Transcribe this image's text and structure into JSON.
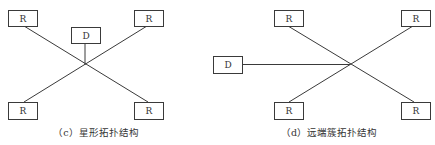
{
  "diagrams": [
    {
      "id": "c",
      "caption": "（c）星形拓扑结构",
      "center": {
        "x": 85,
        "y": 65
      },
      "nodes": [
        {
          "label": "R",
          "pos": "top-left",
          "x": 8,
          "y": 10,
          "w": 29,
          "h": 16
        },
        {
          "label": "R",
          "pos": "top-right",
          "x": 134,
          "y": 10,
          "w": 29,
          "h": 16
        },
        {
          "label": "D",
          "pos": "top-center",
          "x": 71,
          "y": 27,
          "w": 29,
          "h": 16
        },
        {
          "label": "R",
          "pos": "bottom-left",
          "x": 8,
          "y": 102,
          "w": 29,
          "h": 17
        },
        {
          "label": "R",
          "pos": "bottom-right",
          "x": 134,
          "y": 102,
          "w": 29,
          "h": 17
        }
      ]
    },
    {
      "id": "d",
      "caption": "（d）远端簇拓扑结构",
      "center": {
        "x": 350,
        "y": 64
      },
      "nodes": [
        {
          "label": "R",
          "pos": "top-left",
          "x": 274,
          "y": 10,
          "w": 29,
          "h": 16
        },
        {
          "label": "R",
          "pos": "top-right",
          "x": 401,
          "y": 10,
          "w": 29,
          "h": 16
        },
        {
          "label": "D",
          "pos": "left",
          "x": 213,
          "y": 56,
          "w": 29,
          "h": 17
        },
        {
          "label": "R",
          "pos": "bottom-left",
          "x": 274,
          "y": 102,
          "w": 29,
          "h": 17
        },
        {
          "label": "R",
          "pos": "bottom-right",
          "x": 401,
          "y": 102,
          "w": 29,
          "h": 17
        }
      ]
    }
  ]
}
